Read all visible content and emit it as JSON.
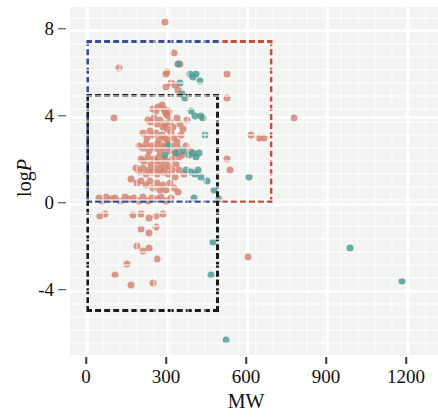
{
  "chart_data": {
    "type": "scatter",
    "title": "",
    "xlabel": "MW",
    "ylabel": "logP",
    "xlim": [
      -60,
      1320
    ],
    "ylim": [
      -7.0,
      9.0
    ],
    "xticks": [
      0,
      300,
      600,
      900,
      1200
    ],
    "yticks": [
      8,
      4,
      0,
      -4
    ],
    "xtick_labels": [
      "0",
      "300",
      "600",
      "900",
      "1200"
    ],
    "ytick_labels": [
      "8",
      "4",
      "0",
      "-4"
    ],
    "grid": true,
    "legend": "none",
    "colors": {
      "series_salmon": "#d4836f",
      "series_teal": "#4e9a94",
      "box_blue": "#3c4c96",
      "box_red": "#c0503c",
      "box_black": "#1b1b1b",
      "panel_background": "#f2f4f1"
    },
    "annotations": [
      {
        "name": "blue-dashed-box",
        "color": "#3c4c96",
        "x0": 0,
        "x1": 700,
        "y0": 0,
        "y1": 7.5
      },
      {
        "name": "red-dashed-box",
        "color": "#c0503c",
        "x0": 0,
        "x1": 700,
        "y0": 0,
        "y1": 7.5
      },
      {
        "name": "black-dashed-box",
        "color": "#1b1b1b",
        "x0": 0,
        "x1": 500,
        "y0": -5.0,
        "y1": 5.0
      }
    ],
    "series": [
      {
        "name": "salmon",
        "color": "#d4836f",
        "points": [
          [
            297,
            8.3
          ],
          [
            330,
            6.9
          ],
          [
            122,
            6.2
          ],
          [
            303,
            6.0
          ],
          [
            301,
            5.9
          ],
          [
            318,
            5.5
          ],
          [
            333,
            5.4
          ],
          [
            300,
            5.3
          ],
          [
            345,
            5.2
          ],
          [
            352,
            6.4
          ],
          [
            104,
            3.9
          ],
          [
            252,
            4.3
          ],
          [
            262,
            4.2
          ],
          [
            270,
            4.4
          ],
          [
            285,
            4.5
          ],
          [
            291,
            4.3
          ],
          [
            296,
            4.2
          ],
          [
            301,
            4.1
          ],
          [
            308,
            4.0
          ],
          [
            312,
            4.2
          ],
          [
            232,
            3.8
          ],
          [
            243,
            3.7
          ],
          [
            255,
            3.9
          ],
          [
            266,
            3.6
          ],
          [
            278,
            3.8
          ],
          [
            288,
            3.5
          ],
          [
            296,
            3.6
          ],
          [
            305,
            3.4
          ],
          [
            316,
            3.7
          ],
          [
            326,
            3.5
          ],
          [
            340,
            3.9
          ],
          [
            352,
            3.6
          ],
          [
            364,
            3.4
          ],
          [
            377,
            3.8
          ],
          [
            214,
            3.2
          ],
          [
            228,
            3.0
          ],
          [
            241,
            3.3
          ],
          [
            253,
            3.1
          ],
          [
            264,
            3.2
          ],
          [
            275,
            2.9
          ],
          [
            286,
            3.1
          ],
          [
            296,
            3.0
          ],
          [
            306,
            2.9
          ],
          [
            318,
            3.2
          ],
          [
            330,
            3.0
          ],
          [
            343,
            2.8
          ],
          [
            356,
            3.1
          ],
          [
            198,
            2.6
          ],
          [
            212,
            2.5
          ],
          [
            226,
            2.7
          ],
          [
            238,
            2.4
          ],
          [
            249,
            2.6
          ],
          [
            259,
            2.5
          ],
          [
            268,
            2.7
          ],
          [
            277,
            2.4
          ],
          [
            286,
            2.6
          ],
          [
            294,
            2.5
          ],
          [
            302,
            2.7
          ],
          [
            311,
            2.4
          ],
          [
            321,
            2.6
          ],
          [
            332,
            2.3
          ],
          [
            345,
            2.5
          ],
          [
            360,
            2.2
          ],
          [
            374,
            2.6
          ],
          [
            390,
            2.4
          ],
          [
            205,
            2.0
          ],
          [
            219,
            1.9
          ],
          [
            231,
            2.1
          ],
          [
            243,
            1.8
          ],
          [
            254,
            2.0
          ],
          [
            264,
            1.9
          ],
          [
            273,
            2.1
          ],
          [
            282,
            1.8
          ],
          [
            291,
            2.0
          ],
          [
            300,
            1.9
          ],
          [
            310,
            1.7
          ],
          [
            322,
            2.0
          ],
          [
            336,
            1.8
          ],
          [
            350,
            2.1
          ],
          [
            186,
            1.6
          ],
          [
            200,
            1.4
          ],
          [
            213,
            1.6
          ],
          [
            225,
            1.3
          ],
          [
            237,
            1.5
          ],
          [
            248,
            1.4
          ],
          [
            258,
            1.6
          ],
          [
            268,
            1.3
          ],
          [
            278,
            1.5
          ],
          [
            288,
            1.4
          ],
          [
            298,
            1.6
          ],
          [
            309,
            1.3
          ],
          [
            321,
            1.5
          ],
          [
            335,
            1.2
          ],
          [
            350,
            1.5
          ],
          [
            366,
            1.3
          ],
          [
            170,
            1.1
          ],
          [
            190,
            0.9
          ],
          [
            208,
            1.0
          ],
          [
            224,
            0.8
          ],
          [
            239,
            1.0
          ],
          [
            252,
            0.7
          ],
          [
            265,
            0.9
          ],
          [
            277,
            0.6
          ],
          [
            289,
            0.8
          ],
          [
            301,
            0.6
          ],
          [
            314,
            0.9
          ],
          [
            329,
            0.7
          ],
          [
            345,
            0.5
          ],
          [
            48,
            0.2
          ],
          [
            60,
            0.1
          ],
          [
            75,
            0.25
          ],
          [
            92,
            0.15
          ],
          [
            110,
            0.2
          ],
          [
            128,
            0.1
          ],
          [
            146,
            0.25
          ],
          [
            163,
            0.15
          ],
          [
            180,
            0.2
          ],
          [
            197,
            0.1
          ],
          [
            214,
            0.25
          ],
          [
            231,
            0.1
          ],
          [
            248,
            0.2
          ],
          [
            265,
            0.15
          ],
          [
            282,
            0.25
          ],
          [
            300,
            0.1
          ],
          [
            320,
            0.2
          ],
          [
            52,
            -0.6
          ],
          [
            70,
            -0.5
          ],
          [
            175,
            -0.55
          ],
          [
            205,
            -0.5
          ],
          [
            238,
            -0.7
          ],
          [
            262,
            -0.6
          ],
          [
            290,
            -0.5
          ],
          [
            205,
            -1.2
          ],
          [
            235,
            -1.4
          ],
          [
            262,
            -1.1
          ],
          [
            192,
            -2.0
          ],
          [
            215,
            -2.2
          ],
          [
            238,
            -2.1
          ],
          [
            265,
            -2.6
          ],
          [
            152,
            -2.8
          ],
          [
            108,
            -3.3
          ],
          [
            170,
            -3.8
          ],
          [
            252,
            -3.7
          ],
          [
            620,
            3.1
          ],
          [
            650,
            3.0
          ],
          [
            668,
            3.0
          ],
          [
            540,
            1.5
          ],
          [
            530,
            5.9
          ],
          [
            530,
            4.8
          ],
          [
            530,
            2.0
          ],
          [
            780,
            3.9
          ],
          [
            608,
            -2.5
          ]
        ]
      },
      {
        "name": "teal",
        "color": "#4e9a94",
        "points": [
          [
            345,
            6.4
          ],
          [
            390,
            5.9
          ],
          [
            402,
            5.8
          ],
          [
            412,
            5.9
          ],
          [
            428,
            5.6
          ],
          [
            352,
            5.5
          ],
          [
            360,
            5.0
          ],
          [
            372,
            4.8
          ],
          [
            395,
            4.2
          ],
          [
            410,
            4.0
          ],
          [
            430,
            4.0
          ],
          [
            440,
            3.9
          ],
          [
            445,
            3.1
          ],
          [
            310,
            2.6
          ],
          [
            296,
            2.2
          ],
          [
            338,
            2.3
          ],
          [
            365,
            2.4
          ],
          [
            388,
            2.2
          ],
          [
            400,
            2.3
          ],
          [
            412,
            2.1
          ],
          [
            425,
            2.3
          ],
          [
            376,
            1.5
          ],
          [
            392,
            1.4
          ],
          [
            408,
            1.3
          ],
          [
            420,
            1.5
          ],
          [
            432,
            1.2
          ],
          [
            452,
            1.0
          ],
          [
            480,
            0.6
          ],
          [
            500,
            0.15
          ],
          [
            404,
            0.2
          ],
          [
            612,
            1.2
          ],
          [
            478,
            -1.8
          ],
          [
            470,
            -3.3
          ],
          [
            525,
            -6.3
          ],
          [
            990,
            -2.1
          ],
          [
            1185,
            -3.6
          ]
        ]
      }
    ]
  },
  "axes": {
    "x_title": "MW",
    "y_title_prefix": "log",
    "y_title_italic": "P"
  }
}
